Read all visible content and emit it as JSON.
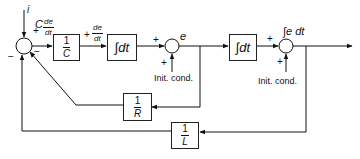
{
  "diagram": {
    "type": "block-diagram",
    "colors": {
      "line": "#111111",
      "background": "#ffffff"
    },
    "inputs": {
      "current": "i"
    },
    "signals": {
      "c_de_dt": {
        "coef": "C",
        "num": "de",
        "den": "dt"
      },
      "de_dt": {
        "num": "de",
        "den": "dt"
      },
      "e": "e",
      "int_e_dt": "∫e dt"
    },
    "blocks": {
      "inv_c": {
        "num": "1",
        "den": "C"
      },
      "integrator1": "∫dt",
      "integrator2": "∫dt",
      "inv_r": {
        "num": "1",
        "den": "R"
      },
      "inv_l": {
        "num": "1",
        "den": "L"
      }
    },
    "summing_junctions": {
      "main": {
        "signs": [
          "+",
          "−",
          "−"
        ]
      },
      "sum_e": {
        "signs": [
          "+",
          "+"
        ],
        "side_input": "Init. cond."
      },
      "sum_int": {
        "signs": [
          "+",
          "+"
        ],
        "side_input": "Init. cond."
      }
    },
    "signs": {
      "plus": "+",
      "minus": "−"
    }
  }
}
